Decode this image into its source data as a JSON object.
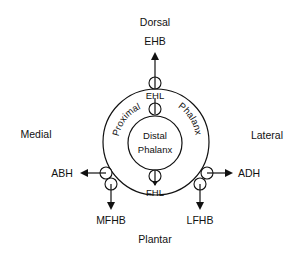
{
  "directions": {
    "dorsal": "Dorsal",
    "plantar": "Plantar",
    "medial": "Medial",
    "lateral": "Lateral"
  },
  "bones": {
    "proximal_word1": "Proximal",
    "proximal_word2": "Phalanx",
    "distal_line1": "Distal",
    "distal_line2": "Phalanx"
  },
  "tendons": {
    "ehb": "EHB",
    "ehl": "EHL",
    "fhl": "FHL",
    "abh": "ABH",
    "adh": "ADH",
    "mfhb": "MFHB",
    "lfhb": "LFHB"
  },
  "colors": {
    "stroke": "#111111",
    "background": "#ffffff"
  }
}
